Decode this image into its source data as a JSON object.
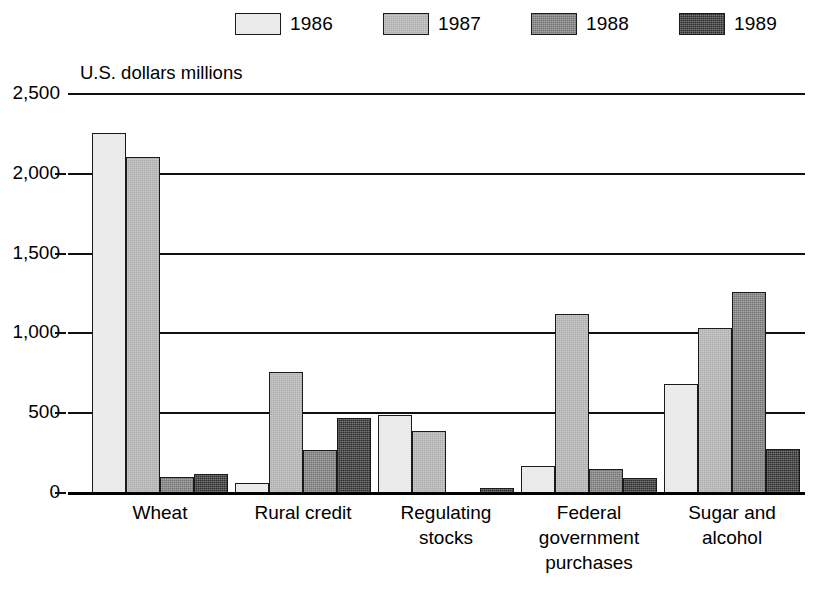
{
  "chart_data": {
    "type": "bar",
    "title": "",
    "subtitle": "",
    "xlabel": "",
    "ylabel": "U.S. dollars millions",
    "categories": [
      "Wheat",
      "Rural credit",
      "Regulating\nstocks",
      "Federal\ngovernment\npurchases",
      "Sugar and\nalcohol"
    ],
    "series": [
      {
        "name": "1986",
        "color": "#e6e6e6",
        "values": [
          2250,
          55,
          480,
          165,
          675
        ]
      },
      {
        "name": "1987",
        "color": "#adadad",
        "values": [
          2100,
          750,
          385,
          1115,
          1030
        ]
      },
      {
        "name": "1988",
        "color": "#757575",
        "values": [
          95,
          265,
          0,
          145,
          1255
        ]
      },
      {
        "name": "1989",
        "color": "#2e2e2e",
        "values": [
          115,
          465,
          25,
          90,
          270
        ]
      }
    ],
    "ylim": [
      0,
      2500
    ],
    "yticks": [
      0,
      500,
      1000,
      1500,
      2000,
      2500
    ],
    "ytick_labels": [
      "0",
      "500",
      "1,000",
      "1,500",
      "2,000",
      "2,500"
    ],
    "grid": true,
    "legend_position": "top",
    "legend_entries": [
      "1986",
      "1987",
      "1988",
      "1989"
    ]
  }
}
